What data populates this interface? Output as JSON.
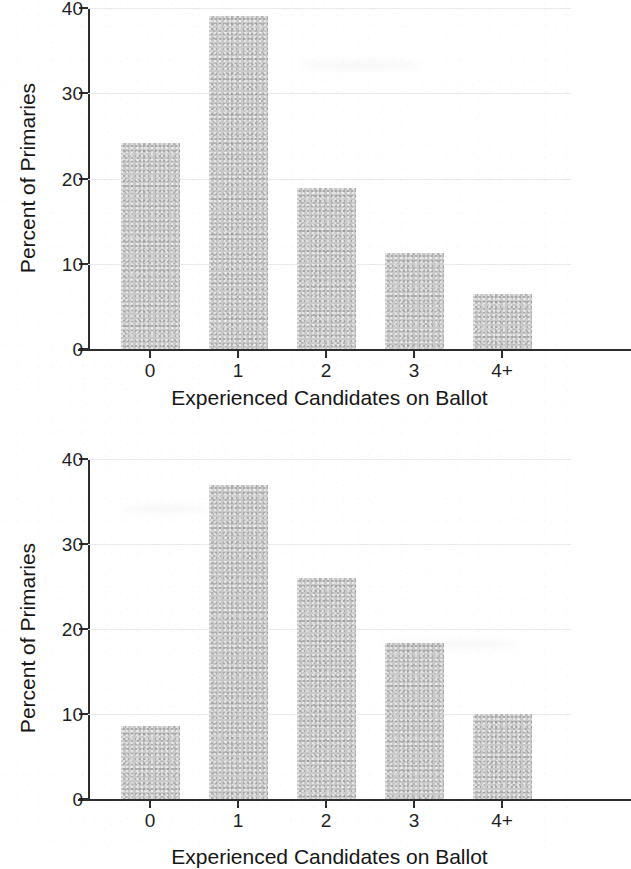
{
  "figures": [
    {
      "id": "top",
      "ylabel": "Percent of Primaries",
      "xlabel": "Experienced Candidates on Ballot",
      "yticks": [
        "0",
        "10",
        "20",
        "30",
        "40"
      ],
      "xticks": [
        "0",
        "1",
        "2",
        "3",
        "4+"
      ],
      "bar_color": "#c9c9c9",
      "axis_color": "#2d2d2d",
      "grid_color": "#e9e9ec"
    },
    {
      "id": "bottom",
      "ylabel": "Percent of Primaries",
      "xlabel": "Experienced Candidates on Ballot",
      "yticks": [
        "0",
        "10",
        "20",
        "30",
        "40"
      ],
      "xticks": [
        "0",
        "1",
        "2",
        "3",
        "4+"
      ],
      "bar_color": "#c9c9c9",
      "axis_color": "#2d2d2d",
      "grid_color": "#e9e9ec"
    }
  ],
  "chart_data": [
    {
      "type": "bar",
      "title": "",
      "panel": "top",
      "categories": [
        "0",
        "1",
        "2",
        "3",
        "4+"
      ],
      "values": [
        24.2,
        39.1,
        18.9,
        11.3,
        6.4
      ],
      "xlabel": "Experienced Candidates on Ballot",
      "ylabel": "Percent of Primaries",
      "ylim": [
        0,
        40
      ],
      "yticks": [
        0,
        10,
        20,
        30,
        40
      ],
      "grid": true,
      "legend": "none",
      "bar_color": "#c9c9c9"
    },
    {
      "type": "bar",
      "title": "",
      "panel": "bottom",
      "categories": [
        "0",
        "1",
        "2",
        "3",
        "4+"
      ],
      "values": [
        8.6,
        37.0,
        26.0,
        18.4,
        10.0
      ],
      "xlabel": "Experienced Candidates on Ballot",
      "ylabel": "Percent of Primaries",
      "ylim": [
        0,
        40
      ],
      "yticks": [
        0,
        10,
        20,
        30,
        40
      ],
      "grid": true,
      "legend": "none",
      "bar_color": "#c9c9c9"
    }
  ]
}
